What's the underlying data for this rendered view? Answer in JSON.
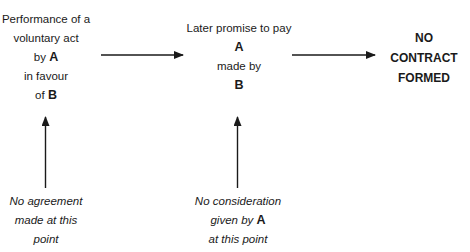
{
  "diagram": {
    "nodes": [
      {
        "id": "act",
        "lines": [
          {
            "text": "Performance of a"
          },
          {
            "text": "voluntary act"
          },
          {
            "prefix": "by ",
            "bold": "A"
          },
          {
            "text": "in favour"
          },
          {
            "prefix": "of ",
            "bold": "B"
          }
        ]
      },
      {
        "id": "promise",
        "lines": [
          {
            "text": "Later promise to pay"
          },
          {
            "bold": "A"
          },
          {
            "text": "made by"
          },
          {
            "bold": "B"
          }
        ]
      },
      {
        "id": "result",
        "lines": [
          {
            "text": "NO"
          },
          {
            "text": "CONTRACT"
          },
          {
            "text": "FORMED"
          }
        ]
      }
    ],
    "notes": [
      {
        "id": "no-agreement",
        "lines": [
          {
            "text": "No agreement"
          },
          {
            "text": "made at this"
          },
          {
            "text": "point"
          }
        ]
      },
      {
        "id": "no-consideration",
        "lines": [
          {
            "text": "No consideration"
          },
          {
            "prefix": "given by ",
            "bold": "A"
          },
          {
            "text": "at this point"
          }
        ]
      }
    ],
    "arrows": [
      {
        "from": "act",
        "to": "promise",
        "direction": "right"
      },
      {
        "from": "promise",
        "to": "result",
        "direction": "right"
      },
      {
        "from": "no-agreement",
        "to": "act",
        "direction": "up"
      },
      {
        "from": "no-consideration",
        "to": "promise",
        "direction": "up"
      }
    ]
  }
}
